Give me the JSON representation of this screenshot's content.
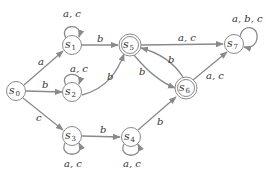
{
  "diagram": {
    "type": "finite-state-automaton",
    "states": [
      {
        "id": "s0",
        "label": "s",
        "sub": "0",
        "x": 16,
        "y": 91,
        "accepting": false,
        "start": true
      },
      {
        "id": "s1",
        "label": "s",
        "sub": "1",
        "x": 72,
        "y": 45,
        "accepting": false
      },
      {
        "id": "s2",
        "label": "s",
        "sub": "2",
        "x": 72,
        "y": 92,
        "accepting": false
      },
      {
        "id": "s3",
        "label": "s",
        "sub": "3",
        "x": 72,
        "y": 136,
        "accepting": false
      },
      {
        "id": "s4",
        "label": "s",
        "sub": "4",
        "x": 131,
        "y": 137,
        "accepting": false
      },
      {
        "id": "s5",
        "label": "s",
        "sub": "5",
        "x": 130,
        "y": 45,
        "accepting": true
      },
      {
        "id": "s6",
        "label": "s",
        "sub": "6",
        "x": 186,
        "y": 88,
        "accepting": true
      },
      {
        "id": "s7",
        "label": "s",
        "sub": "7",
        "x": 234,
        "y": 44,
        "accepting": false
      }
    ],
    "transitions": [
      {
        "from": "s0",
        "to": "s1",
        "label": "a"
      },
      {
        "from": "s0",
        "to": "s2",
        "label": "b"
      },
      {
        "from": "s0",
        "to": "s3",
        "label": "c"
      },
      {
        "from": "s1",
        "to": "s1",
        "label": "a, c"
      },
      {
        "from": "s1",
        "to": "s5",
        "label": "b"
      },
      {
        "from": "s2",
        "to": "s2",
        "label": "a, c"
      },
      {
        "from": "s2",
        "to": "s5",
        "label": "b"
      },
      {
        "from": "s3",
        "to": "s3",
        "label": "a, c"
      },
      {
        "from": "s3",
        "to": "s4",
        "label": "b"
      },
      {
        "from": "s4",
        "to": "s4",
        "label": "a, c"
      },
      {
        "from": "s4",
        "to": "s6",
        "label": "b"
      },
      {
        "from": "s5",
        "to": "s7",
        "label": "a, c"
      },
      {
        "from": "s5",
        "to": "s6",
        "label": "b"
      },
      {
        "from": "s6",
        "to": "s5",
        "label": "b"
      },
      {
        "from": "s6",
        "to": "s7",
        "label": "a, c"
      },
      {
        "from": "s7",
        "to": "s7",
        "label": "a, b, c"
      }
    ]
  },
  "labels": {
    "s0_sub": "0",
    "s1_sub": "1",
    "s2_sub": "2",
    "s3_sub": "3",
    "s4_sub": "4",
    "s5_sub": "5",
    "s6_sub": "6",
    "s7_sub": "7",
    "s": "s",
    "e_s0_s1": "a",
    "e_s0_s2": "b",
    "e_s0_s3": "c",
    "e_s1_loop": "a, c",
    "e_s1_s5": "b",
    "e_s2_loop": "a, c",
    "e_s2_s5": "b",
    "e_s3_loop": "a, c",
    "e_s3_s4": "b",
    "e_s4_loop": "a, c",
    "e_s4_s6": "b",
    "e_s5_s7": "a, c",
    "e_s5_s6": "b",
    "e_s6_s5": "b",
    "e_s6_s7": "a, c",
    "e_s7_loop": "a, b, c"
  },
  "colors": {
    "edge": "#8a8a8a",
    "text": "#333333",
    "background": "#ffffff"
  }
}
